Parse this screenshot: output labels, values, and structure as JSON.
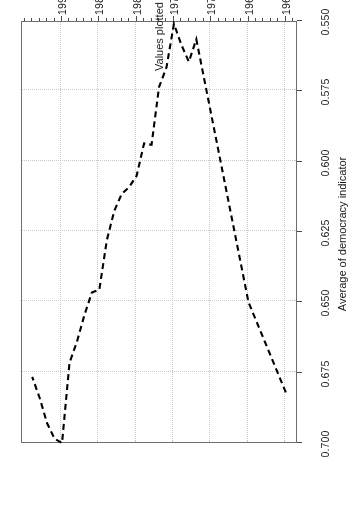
{
  "figure": {
    "background_color": "#ffffff",
    "frame_color": "#6e6e6e",
    "grid_color": "#c8c8c8",
    "line_color": "#000000",
    "orientation_note": "rotated-180"
  },
  "axes": {
    "y_axis_title": "Average of democracy indicator",
    "x_axis_title": "Values plotted for 1960, 1965, and 1972–1994",
    "y_ticks": [
      "0.550",
      "0.575",
      "0.600",
      "0.625",
      "0.650",
      "0.675",
      "0.700"
    ],
    "x_ticks": [
      "1960",
      "1965",
      "1970",
      "1975",
      "1980",
      "1985",
      "1990"
    ]
  },
  "chart_data": {
    "type": "line",
    "title": "",
    "subtitle": "",
    "xlabel": "Values plotted for 1960, 1965, and 1972–1994",
    "ylabel": "Average of democracy indicator",
    "xlim": [
      1958.5,
      1995.5
    ],
    "ylim": [
      0.55,
      0.7
    ],
    "grid": true,
    "legend": null,
    "linestyle": "dashed",
    "x": [
      1960,
      1965,
      1972,
      1973,
      1974,
      1975,
      1976,
      1977,
      1978,
      1979,
      1980,
      1981,
      1982,
      1983,
      1984,
      1985,
      1986,
      1987,
      1988,
      1989,
      1990,
      1991,
      1992,
      1993,
      1994
    ],
    "y": [
      0.682,
      0.65,
      0.5565,
      0.5645,
      0.5585,
      0.551,
      0.5665,
      0.5735,
      0.594,
      0.5935,
      0.605,
      0.609,
      0.6115,
      0.6175,
      0.628,
      0.6455,
      0.6465,
      0.6545,
      0.664,
      0.6715,
      0.7,
      0.6985,
      0.693,
      0.684,
      0.6765
    ],
    "series": [
      {
        "name": "Average of democracy indicator",
        "values": [
          0.682,
          0.65,
          0.5565,
          0.5645,
          0.5585,
          0.551,
          0.5665,
          0.5735,
          0.594,
          0.5935,
          0.605,
          0.609,
          0.6115,
          0.6175,
          0.628,
          0.6455,
          0.6465,
          0.6545,
          0.664,
          0.6715,
          0.7,
          0.6985,
          0.693,
          0.684,
          0.6765
        ]
      }
    ]
  }
}
